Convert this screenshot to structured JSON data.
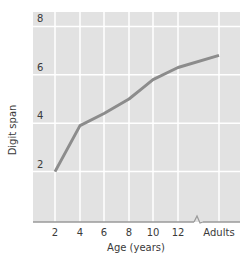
{
  "chart_data": {
    "type": "line",
    "title": "",
    "xlabel": "Age (years)",
    "ylabel": "Digit span",
    "x_tick_labels": [
      "2",
      "4",
      "6",
      "8",
      "10",
      "12",
      "Adults"
    ],
    "y_tick_labels": [
      "2",
      "4",
      "6",
      "8"
    ],
    "ylim": [
      0,
      8.6
    ],
    "grid": true,
    "axis_break": "between 12 and Adults on x-axis",
    "series": [
      {
        "name": "Digit span",
        "x": [
          "2",
          "4",
          "6",
          "8",
          "9",
          "10",
          "12",
          "Adults"
        ],
        "values": [
          2.0,
          3.9,
          4.4,
          5.0,
          5.4,
          5.8,
          6.3,
          6.8
        ]
      }
    ],
    "colors": {
      "plot_background": "#e2e2e2",
      "grid": "#ffffff",
      "line": "#8c8c8c",
      "axis": "#9a9a9a"
    }
  }
}
